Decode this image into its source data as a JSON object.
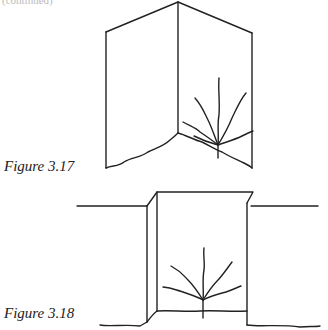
{
  "page": {
    "top_fragment": "(continued)",
    "figures": [
      {
        "caption": "Figure 3.17",
        "description": "Two hinged panels forming a V-shaped corner with a seedling and roots at the base of the inner corner"
      },
      {
        "caption": "Figure 3.18",
        "description": "A rectangular trench cut into ground level with a seedling and spreading roots inside"
      }
    ]
  }
}
